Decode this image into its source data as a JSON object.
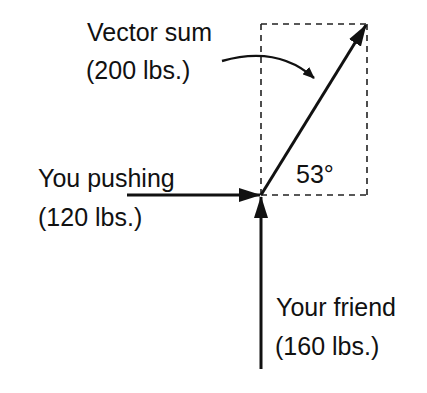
{
  "diagram": {
    "labels": {
      "vector_sum_title": "Vector sum",
      "vector_sum_value": "(200 lbs.)",
      "you_title": "You pushing",
      "you_value": "(120 lbs.)",
      "friend_title": "Your friend",
      "friend_value": "(160 lbs.)",
      "angle": "53°"
    },
    "vectors": [
      {
        "name": "You pushing",
        "magnitude_lbs": 120,
        "direction": "right"
      },
      {
        "name": "Your friend",
        "magnitude_lbs": 160,
        "direction": "up"
      },
      {
        "name": "Vector sum",
        "magnitude_lbs": 200,
        "angle_deg": 53
      }
    ],
    "colors": {
      "ink": "#111111",
      "background": "#ffffff"
    }
  }
}
